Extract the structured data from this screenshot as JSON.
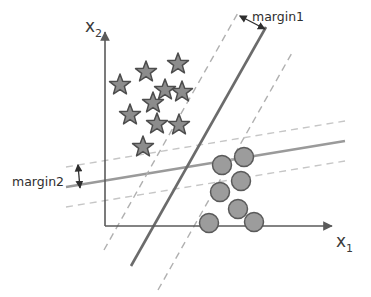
{
  "figure": {
    "title_visible": false,
    "background_color": "#ffffff",
    "width": 371,
    "height": 297
  },
  "axes": {
    "x_axis": {
      "label_main": "x",
      "label_sub": "1",
      "name": "x1",
      "color": "#5a5a5a",
      "origin": {
        "x": 105,
        "y": 226
      },
      "end": {
        "x": 330,
        "y": 226
      }
    },
    "y_axis": {
      "label_main": "x",
      "label_sub": "2",
      "name": "x2",
      "color": "#5a5a5a",
      "origin": {
        "x": 105,
        "y": 226
      },
      "end": {
        "x": 105,
        "y": 34
      }
    }
  },
  "annotations": {
    "margin1": {
      "label": "margin1",
      "label_x": 252,
      "label_y": 17,
      "arrow_from": {
        "x": 240,
        "y": 16
      },
      "arrow_to": {
        "x": 265,
        "y": 29
      },
      "color": "#2e2e2e"
    },
    "margin2": {
      "label": "margin2",
      "label_x": 12,
      "label_y": 185,
      "arrow_from": {
        "x": 78,
        "y": 166
      },
      "arrow_to": {
        "x": 80,
        "y": 187
      },
      "color": "#2e2e2e"
    }
  },
  "classifiers": [
    {
      "id": "steep-classifier",
      "name": "steep-decision-boundary",
      "style": "solid",
      "color": "#6b6b6b",
      "stroke_width": 2.6,
      "x1": 131,
      "y1": 266,
      "x2": 266,
      "y2": 27,
      "margin_label": "margin1",
      "support_lines": [
        {
          "id": "steep-margin-upper",
          "style": "dashed",
          "color": "#a8a8a8",
          "x1": 158,
          "y1": 288,
          "x2": 293,
          "y2": 49
        },
        {
          "id": "steep-margin-lower",
          "style": "dashed",
          "color": "#a8a8a8",
          "x1": 104,
          "y1": 250,
          "x2": 239,
          "y2": 11
        }
      ]
    },
    {
      "id": "shallow-classifier",
      "name": "shallow-decision-boundary",
      "style": "solid",
      "color": "#9a9a9a",
      "stroke_width": 2.4,
      "x1": 66,
      "y1": 187,
      "x2": 345,
      "y2": 141,
      "margin_label": "margin2",
      "support_lines": [
        {
          "id": "shallow-margin-upper",
          "style": "dashed",
          "color": "#c2c2c2",
          "x1": 66,
          "y1": 167,
          "x2": 345,
          "y2": 121
        },
        {
          "id": "shallow-margin-lower",
          "style": "dashed",
          "color": "#c2c2c2",
          "x1": 66,
          "y1": 207,
          "x2": 345,
          "y2": 161
        }
      ]
    }
  ],
  "chart_data": {
    "type": "scatter",
    "title": "",
    "xlabel": "x1",
    "ylabel": "x2",
    "grid": false,
    "legend_position": "none",
    "annotations": [
      "margin1",
      "margin2"
    ],
    "series": [
      {
        "name": "class-star",
        "marker": "star",
        "fill": "#8c8c8c",
        "stroke": "#4d4d4d",
        "count": 10,
        "points": [
          {
            "x": 120,
            "y": 85
          },
          {
            "x": 146,
            "y": 72
          },
          {
            "x": 178,
            "y": 64
          },
          {
            "x": 182,
            "y": 92
          },
          {
            "x": 153,
            "y": 103
          },
          {
            "x": 130,
            "y": 115
          },
          {
            "x": 157,
            "y": 124
          },
          {
            "x": 179,
            "y": 125
          },
          {
            "x": 143,
            "y": 147
          },
          {
            "x": 165,
            "y": 90
          }
        ]
      },
      {
        "name": "class-circle",
        "marker": "circle",
        "fill": "#9c9c9c",
        "stroke": "#5a5a5a",
        "count": 7,
        "points": [
          {
            "x": 222,
            "y": 165
          },
          {
            "x": 244,
            "y": 157
          },
          {
            "x": 241,
            "y": 181
          },
          {
            "x": 220,
            "y": 192
          },
          {
            "x": 238,
            "y": 209
          },
          {
            "x": 209,
            "y": 223
          },
          {
            "x": 254,
            "y": 222
          }
        ]
      }
    ]
  },
  "markers": {
    "star_radius_outer": 11,
    "star_radius_inner": 4.6,
    "circle_radius": 9.5
  }
}
